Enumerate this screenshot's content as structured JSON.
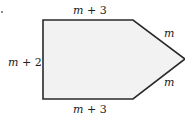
{
  "diagram": {
    "shape": "pentagon",
    "fill_color": "#f2f2f2",
    "stroke_color": "#2a2a2a",
    "labels": {
      "top": {
        "var": "m",
        "rest": " + 3"
      },
      "left": {
        "var": "m",
        "rest": " + 2"
      },
      "bottom": {
        "var": "m",
        "rest": " + 3"
      },
      "upper_right": {
        "var": "m"
      },
      "lower_right": {
        "var": "m"
      }
    }
  }
}
